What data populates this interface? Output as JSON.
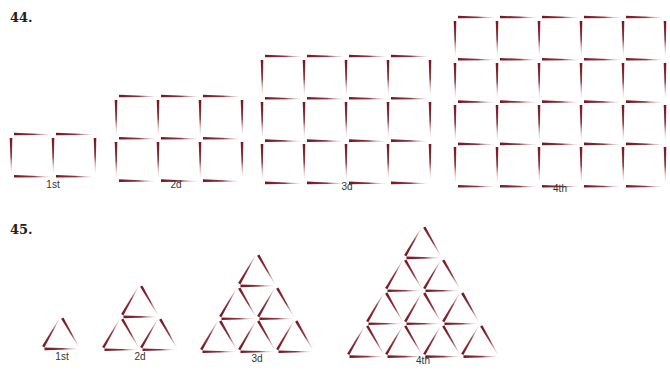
{
  "problems": [
    {
      "number": "44.",
      "shape": "square",
      "figures": [
        {
          "label": "1st",
          "cols": 2,
          "rows": 1
        },
        {
          "label": "2d",
          "cols": 3,
          "rows": 2
        },
        {
          "label": "3d",
          "cols": 4,
          "rows": 3
        },
        {
          "label": "4th",
          "cols": 5,
          "rows": 4
        }
      ]
    },
    {
      "number": "45.",
      "shape": "triangle",
      "figures": [
        {
          "label": "1st",
          "rows": 1
        },
        {
          "label": "2d",
          "rows": 2
        },
        {
          "label": "3d",
          "rows": 3
        },
        {
          "label": "4th",
          "rows": 4
        }
      ]
    }
  ],
  "colors": {
    "match_head": "#7a1520",
    "match_tail": "#f2dede"
  }
}
